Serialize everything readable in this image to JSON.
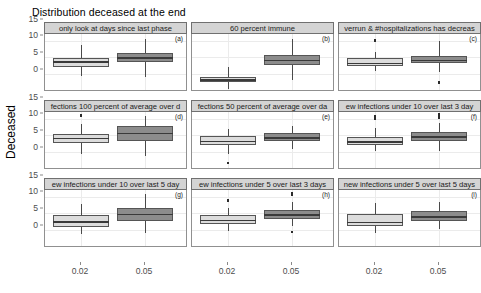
{
  "chart_data": {
    "type": "table",
    "title": "Distribution deceased at the end",
    "xlabel": "",
    "ylabel": "Deceased",
    "ylim": [
      0,
      17
    ],
    "yticks": [
      0,
      5,
      10,
      15
    ],
    "categories": [
      "0.02",
      "0.05"
    ],
    "grid": true,
    "legend": "none",
    "plot_style": "boxplot grid (3 x 3 facets)",
    "series_colors": {
      "0.02": "#dcdcdc",
      "0.05": "#8c8c8c"
    },
    "panels": [
      {
        "tag": "(a)",
        "strip_title": "only look at days since last phase",
        "boxes": [
          {
            "category": "0.02",
            "fill": "light",
            "min": 4.3,
            "q1": 7.0,
            "median": 8.6,
            "q3": 9.6,
            "max": 13.3,
            "outliers": []
          },
          {
            "category": "0.05",
            "fill": "dark",
            "min": 4.0,
            "q1": 8.4,
            "median": 9.7,
            "q3": 11.0,
            "max": 15.3,
            "outliers": []
          }
        ]
      },
      {
        "tag": "(b)",
        "strip_title": "60 percent immune",
        "boxes": [
          {
            "category": "0.02",
            "fill": "light",
            "min": 0.4,
            "q1": 2.4,
            "median": 3.2,
            "q3": 4.0,
            "max": 7.0,
            "outliers": []
          },
          {
            "category": "0.05",
            "fill": "dark",
            "min": 3.0,
            "q1": 7.6,
            "median": 9.0,
            "q3": 10.3,
            "max": 15.2,
            "outliers": []
          }
        ]
      },
      {
        "tag": "(c)",
        "strip_title": "verrun & #hospitalizations has decreas",
        "boxes": [
          {
            "category": "0.02",
            "fill": "light",
            "min": 5.6,
            "q1": 7.1,
            "median": 8.2,
            "q3": 9.4,
            "max": 11.4,
            "outliers": [
              14.7
            ]
          },
          {
            "category": "0.05",
            "fill": "dark",
            "min": 5.4,
            "q1": 8.0,
            "median": 9.0,
            "q3": 10.1,
            "max": 14.6,
            "outliers": [
              2.3
            ]
          }
        ]
      },
      {
        "tag": "(d)",
        "strip_title": "fections 100 percent of average over d",
        "boxes": [
          {
            "category": "0.02",
            "fill": "light",
            "min": 4.3,
            "q1": 7.6,
            "median": 9.0,
            "q3": 10.0,
            "max": 13.0,
            "outliers": [
              15.7
            ]
          },
          {
            "category": "0.05",
            "fill": "dark",
            "min": 3.6,
            "q1": 8.1,
            "median": 10.5,
            "q3": 12.5,
            "max": 15.6,
            "outliers": []
          }
        ]
      },
      {
        "tag": "(e)",
        "strip_title": "fections 50 percent of average over da",
        "boxes": [
          {
            "category": "0.02",
            "fill": "light",
            "min": 4.1,
            "q1": 6.8,
            "median": 8.2,
            "q3": 9.4,
            "max": 11.6,
            "outliers": [
              1.5
            ]
          },
          {
            "category": "0.05",
            "fill": "dark",
            "min": 5.6,
            "q1": 8.0,
            "median": 9.2,
            "q3": 10.4,
            "max": 12.6,
            "outliers": []
          }
        ]
      },
      {
        "tag": "(f)",
        "strip_title": "ew infections under 10 over last 3 day",
        "boxes": [
          {
            "category": "0.02",
            "fill": "light",
            "min": 5.0,
            "q1": 6.9,
            "median": 8.0,
            "q3": 9.3,
            "max": 11.8,
            "outliers": [
              14.6,
              15.4
            ]
          },
          {
            "category": "0.05",
            "fill": "dark",
            "min": 5.2,
            "q1": 8.2,
            "median": 9.4,
            "q3": 10.6,
            "max": 13.4,
            "outliers": [
              15.1,
              15.9
            ]
          }
        ]
      },
      {
        "tag": "(g)",
        "strip_title": "ew infections under 10 over last 5 day",
        "boxes": [
          {
            "category": "0.02",
            "fill": "light",
            "min": 3.6,
            "q1": 5.8,
            "median": 7.4,
            "q3": 9.2,
            "max": 12.6,
            "outliers": []
          },
          {
            "category": "0.05",
            "fill": "dark",
            "min": 3.8,
            "q1": 7.5,
            "median": 9.6,
            "q3": 11.4,
            "max": 15.4,
            "outliers": []
          }
        ]
      },
      {
        "tag": "(h)",
        "strip_title": "ew infections under 5 over last 3 days",
        "boxes": [
          {
            "category": "0.02",
            "fill": "light",
            "min": 4.4,
            "q1": 6.6,
            "median": 7.8,
            "q3": 9.2,
            "max": 11.2,
            "outliers": [
              13.6
            ]
          },
          {
            "category": "0.05",
            "fill": "dark",
            "min": 6.0,
            "q1": 8.2,
            "median": 9.4,
            "q3": 10.6,
            "max": 13.2,
            "outliers": [
              15.2,
              15.8,
              4.2
            ]
          }
        ]
      },
      {
        "tag": "(i)",
        "strip_title": "new infections under 5 over last 5 days",
        "boxes": [
          {
            "category": "0.02",
            "fill": "light",
            "min": 3.8,
            "q1": 6.0,
            "median": 7.3,
            "q3": 9.4,
            "max": 12.8,
            "outliers": []
          },
          {
            "category": "0.05",
            "fill": "dark",
            "min": 5.0,
            "q1": 7.6,
            "median": 8.8,
            "q3": 10.4,
            "max": 13.2,
            "outliers": []
          }
        ]
      }
    ]
  }
}
